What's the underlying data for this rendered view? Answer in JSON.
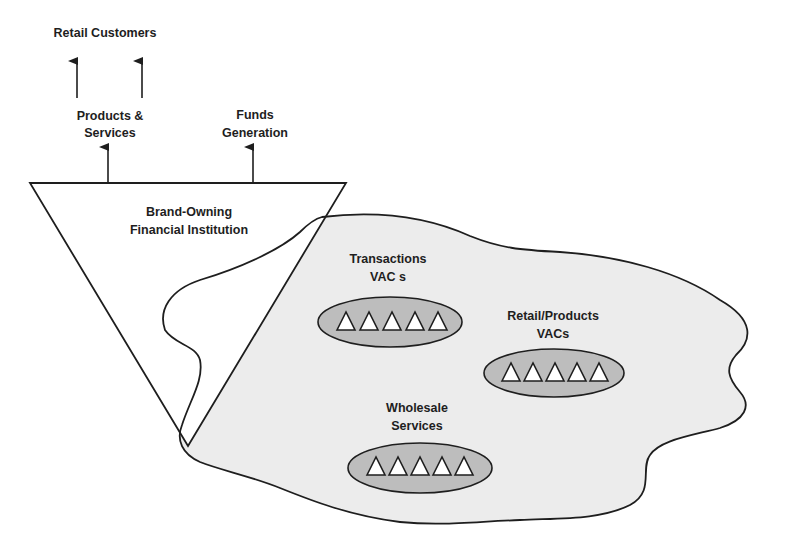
{
  "labels": {
    "retail_customers": "Retail Customers",
    "products_services_line1": "Products &",
    "products_services_line2": "Services",
    "funds_generation_line1": "Funds",
    "funds_generation_line2": "Generation",
    "brand_owner_line1": "Brand-Owning",
    "brand_owner_line2": "Financial Institution",
    "transactions_line1": "Transactions",
    "transactions_line2": "VAC s",
    "retail_products_line1": "Retail/Products",
    "retail_products_line2": "VACs",
    "wholesale_line1": "Wholesale",
    "wholesale_line2": "Services"
  },
  "clusters": [
    {
      "name": "Transactions VACs",
      "member_count": 5
    },
    {
      "name": "Retail/Products VACs",
      "member_count": 5
    },
    {
      "name": "Wholesale Services",
      "member_count": 5
    }
  ],
  "colors": {
    "background": "#ffffff",
    "blob_fill": "#ececec",
    "cluster_fill": "#bdbdbd",
    "member_fill": "#ffffff",
    "stroke": "#1e1e1e"
  }
}
